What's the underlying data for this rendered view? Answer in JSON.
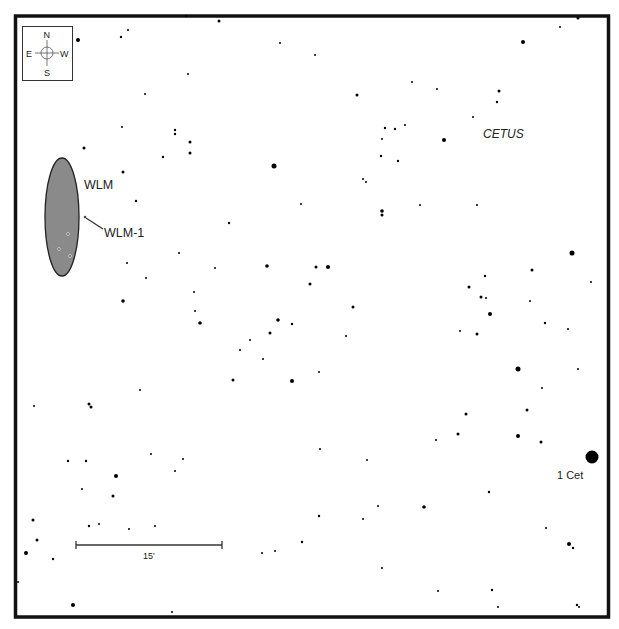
{
  "chart": {
    "constellation_label": "CETUS",
    "compass": {
      "north": "N",
      "south": "S",
      "east": "E",
      "west": "W"
    },
    "galaxy": {
      "name": "WLM",
      "fill": "#8a8a8a",
      "cx": 62,
      "cy": 217,
      "rx": 17,
      "ry": 59
    },
    "object_label": "WLM-1",
    "named_star": {
      "label": "1 Cet",
      "x": 592,
      "y": 457,
      "r": 6.5
    },
    "scale_bar": {
      "label": "15'",
      "x1": 76,
      "x2": 222,
      "y": 545
    },
    "frame": {
      "x": 15,
      "y": 16,
      "w": 594,
      "h": 601,
      "stroke": "#111111"
    }
  },
  "stars": [
    [
      78,
      40,
      2
    ],
    [
      121,
      37,
      1.2
    ],
    [
      128,
      30,
      1
    ],
    [
      219,
      21,
      1.5
    ],
    [
      188,
      74,
      1
    ],
    [
      145,
      94,
      1
    ],
    [
      175,
      130,
      1.2
    ],
    [
      175,
      134,
      1.2
    ],
    [
      190,
      142,
      1.5
    ],
    [
      190,
      153,
      1.5
    ],
    [
      163,
      157,
      1.2
    ],
    [
      123,
      172,
      1.5
    ],
    [
      84,
      148,
      1.5
    ],
    [
      136,
      201,
      1.2
    ],
    [
      274,
      166,
      2.5
    ],
    [
      301,
      204,
      1
    ],
    [
      280,
      43,
      1
    ],
    [
      315,
      55,
      1
    ],
    [
      229,
      223,
      1.2
    ],
    [
      122,
      127,
      1
    ],
    [
      186,
      16,
      1
    ],
    [
      357,
      95,
      1.5
    ],
    [
      385,
      128,
      1.2
    ],
    [
      395,
      129,
      1.2
    ],
    [
      405,
      125,
      1
    ],
    [
      412,
      82,
      1
    ],
    [
      444,
      140,
      2
    ],
    [
      381,
      156,
      1.2
    ],
    [
      398,
      161,
      1.2
    ],
    [
      382,
      139,
      1
    ],
    [
      363,
      179,
      1
    ],
    [
      366,
      182,
      1
    ],
    [
      382,
      211,
      1.8
    ],
    [
      382,
      215,
      1.5
    ],
    [
      420,
      205,
      1
    ],
    [
      477,
      205,
      1
    ],
    [
      523,
      42,
      2
    ],
    [
      560,
      27,
      1
    ],
    [
      578,
      18,
      1.5
    ],
    [
      499,
      91,
      1.5
    ],
    [
      497,
      102,
      1.2
    ],
    [
      437,
      89,
      1
    ],
    [
      473,
      117,
      1
    ],
    [
      267,
      266,
      1.8
    ],
    [
      316,
      267,
      1.5
    ],
    [
      328,
      267,
      2
    ],
    [
      310,
      284,
      1.5
    ],
    [
      215,
      268,
      1
    ],
    [
      179,
      253,
      1
    ],
    [
      146,
      278,
      1
    ],
    [
      123,
      301,
      1.8
    ],
    [
      194,
      292,
      1
    ],
    [
      195,
      311,
      1
    ],
    [
      200,
      323,
      1.8
    ],
    [
      278,
      320,
      1.8
    ],
    [
      292,
      324,
      1.2
    ],
    [
      270,
      333,
      1.5
    ],
    [
      250,
      340,
      1
    ],
    [
      240,
      350,
      1
    ],
    [
      263,
      359,
      1
    ],
    [
      353,
      307,
      1.5
    ],
    [
      346,
      336,
      1
    ],
    [
      233,
      380,
      1.5
    ],
    [
      292,
      381,
      2
    ],
    [
      319,
      372,
      1
    ],
    [
      127,
      263,
      1
    ],
    [
      572,
      253,
      2.5
    ],
    [
      532,
      270,
      1.5
    ],
    [
      485,
      276,
      1.2
    ],
    [
      469,
      287,
      1.5
    ],
    [
      481,
      297,
      1.5
    ],
    [
      486,
      298,
      1
    ],
    [
      490,
      314,
      2
    ],
    [
      530,
      301,
      1
    ],
    [
      545,
      323,
      1.2
    ],
    [
      568,
      329,
      1
    ],
    [
      460,
      331,
      1
    ],
    [
      477,
      334,
      1.5
    ],
    [
      591,
      282,
      1
    ],
    [
      518,
      369,
      2.5
    ],
    [
      578,
      369,
      1
    ],
    [
      542,
      388,
      1
    ],
    [
      527,
      410,
      1.5
    ],
    [
      466,
      414,
      1.5
    ],
    [
      458,
      434,
      1.5
    ],
    [
      436,
      440,
      1
    ],
    [
      518,
      436,
      2
    ],
    [
      541,
      442,
      1.5
    ],
    [
      34,
      406,
      1
    ],
    [
      89,
      404,
      1.5
    ],
    [
      91,
      407,
      1.5
    ],
    [
      140,
      390,
      1
    ],
    [
      68,
      461,
      1.2
    ],
    [
      86,
      461,
      1.2
    ],
    [
      116,
      476,
      2
    ],
    [
      82,
      489,
      1
    ],
    [
      113,
      496,
      1.5
    ],
    [
      151,
      454,
      1
    ],
    [
      175,
      471,
      1
    ],
    [
      183,
      459,
      1
    ],
    [
      33,
      520,
      1.5
    ],
    [
      37,
      540,
      1.5
    ],
    [
      26,
      553,
      2
    ],
    [
      53,
      559,
      1.2
    ],
    [
      89,
      526,
      1.2
    ],
    [
      99,
      524,
      1
    ],
    [
      129,
      529,
      1
    ],
    [
      155,
      526,
      1
    ],
    [
      320,
      449,
      1
    ],
    [
      367,
      460,
      1
    ],
    [
      424,
      507,
      1.8
    ],
    [
      378,
      506,
      1
    ],
    [
      319,
      516,
      1.2
    ],
    [
      363,
      519,
      1
    ],
    [
      302,
      542,
      1.2
    ],
    [
      275,
      551,
      1
    ],
    [
      262,
      553,
      1
    ],
    [
      382,
      568,
      1
    ],
    [
      489,
      492,
      1.2
    ],
    [
      546,
      528,
      1
    ],
    [
      569,
      544,
      2
    ],
    [
      573,
      548,
      1.2
    ],
    [
      492,
      590,
      1.2
    ],
    [
      438,
      591,
      1
    ],
    [
      498,
      607,
      1
    ],
    [
      577,
      605,
      1.2
    ],
    [
      579,
      607,
      1
    ],
    [
      73,
      605,
      2
    ],
    [
      172,
      612,
      1
    ],
    [
      18,
      582,
      1
    ]
  ],
  "galaxy_stars": [
    [
      85,
      217,
      1.5
    ],
    [
      68,
      234,
      1.3
    ],
    [
      59,
      249,
      1.3
    ],
    [
      70,
      256,
      1.3
    ]
  ]
}
